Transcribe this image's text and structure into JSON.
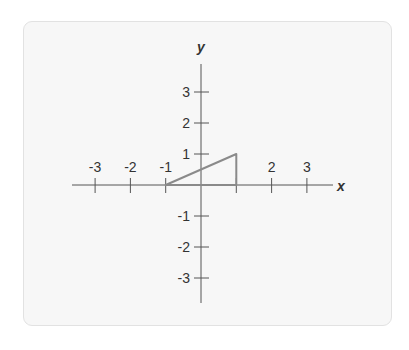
{
  "diagram": {
    "axes": {
      "x_label": "x",
      "y_label": "y",
      "x_ticks": [
        {
          "value": -3,
          "label": "-3"
        },
        {
          "value": -2,
          "label": "-2"
        },
        {
          "value": -1,
          "label": "-1"
        },
        {
          "value": 1,
          "label": ""
        },
        {
          "value": 2,
          "label": "2"
        },
        {
          "value": 3,
          "label": "3"
        }
      ],
      "y_ticks": [
        {
          "value": 3,
          "label": "3"
        },
        {
          "value": 2,
          "label": "2"
        },
        {
          "value": 1,
          "label": "1"
        },
        {
          "value": -1,
          "label": "-1"
        },
        {
          "value": -2,
          "label": "-2"
        },
        {
          "value": -3,
          "label": "-3"
        }
      ]
    },
    "triangle": {
      "vertices": [
        [
          -1,
          0
        ],
        [
          1,
          0
        ],
        [
          1,
          1
        ]
      ],
      "stroke_color": "#8a8a8a"
    },
    "axis_color": "#555555",
    "panel_color": "#f7f7f7"
  }
}
